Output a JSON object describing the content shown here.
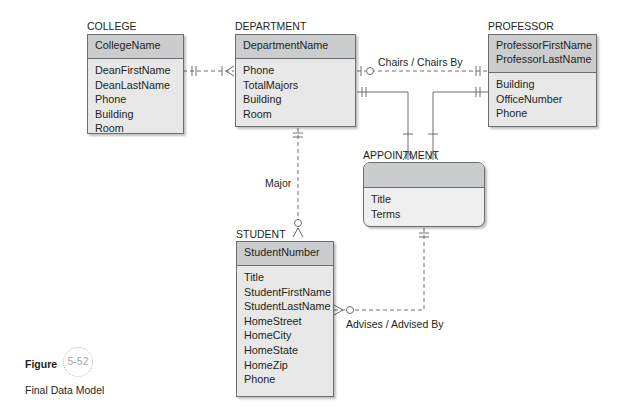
{
  "entities": {
    "college": {
      "title": "COLLEGE",
      "key": [
        "CollegeName"
      ],
      "attributes": [
        "DeanFirstName",
        "DeanLastName",
        "Phone",
        "Building",
        "Room"
      ]
    },
    "department": {
      "title": "DEPARTMENT",
      "key": [
        "DepartmentName"
      ],
      "attributes": [
        "Phone",
        "TotalMajors",
        "Building",
        "Room"
      ]
    },
    "professor": {
      "title": "PROFESSOR",
      "key": [
        "ProfessorFirstName",
        "ProfessorLastName"
      ],
      "attributes": [
        "Building",
        "OfficeNumber",
        "Phone"
      ]
    },
    "appointment": {
      "title": "APPOINTMENT",
      "key": [],
      "attributes": [
        "Title",
        "Terms"
      ]
    },
    "student": {
      "title": "STUDENT",
      "key": [
        "StudentNumber"
      ],
      "attributes": [
        "Title",
        "StudentFirstName",
        "StudentLastName",
        "HomeStreet",
        "HomeCity",
        "HomeState",
        "HomeZip",
        "Phone"
      ]
    }
  },
  "relationships": {
    "chairs": "Chairs / Chairs By",
    "major": "Major",
    "advises": "Advises / Advised By"
  },
  "figure": {
    "label": "Figure",
    "number": "5-52",
    "caption": "Final Data Model"
  },
  "colors": {
    "key_fill": "#cbcccd",
    "body_fill": "#e8e8e8",
    "border": "#6d6e70",
    "line": "#6d6e70",
    "figure_circle": "#a7a9ac"
  }
}
